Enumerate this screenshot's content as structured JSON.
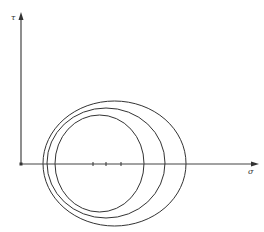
{
  "diagram": {
    "type": "mohr-circles",
    "axes": {
      "x_label": "σ",
      "y_label": "τ"
    },
    "circles": [
      {
        "name": "small",
        "cx": 99.5,
        "rx": 44.5,
        "ry": 48.5
      },
      {
        "name": "medium",
        "cx": 106,
        "rx": 59,
        "ry": 55
      },
      {
        "name": "large",
        "cx": 114.5,
        "rx": 71.5,
        "ry": 62.5
      }
    ],
    "ticks_x": [
      93,
      106,
      121
    ],
    "colors": {
      "line": "#333333",
      "background": "#ffffff"
    }
  }
}
